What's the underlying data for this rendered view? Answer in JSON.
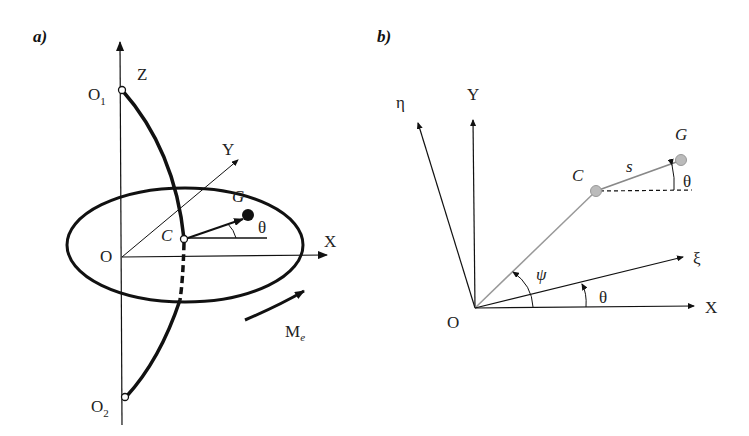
{
  "panels": {
    "a": {
      "label": "a)",
      "axes": {
        "z": "Z",
        "y": "Y",
        "x": "X",
        "origin": "O"
      },
      "points": {
        "o1": "O",
        "o1_sub": "1",
        "o2": "O",
        "o2_sub": "2",
        "c": "C",
        "g": "G"
      },
      "angle": "θ",
      "moment": "M",
      "moment_sub": "e"
    },
    "b": {
      "label": "b)",
      "axes": {
        "eta": "η",
        "y": "Y",
        "xi": "ξ",
        "x": "X",
        "origin": "O"
      },
      "points": {
        "c": "C",
        "g": "G"
      },
      "segment": "s",
      "angles": {
        "theta_g": "θ",
        "psi": "ψ",
        "theta_xi": "θ"
      }
    }
  },
  "colors": {
    "ink": "#111111",
    "gray_line": "#999999",
    "gray_point": "#bbbbbb"
  }
}
